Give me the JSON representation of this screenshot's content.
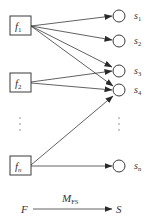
{
  "diagram": {
    "colors": {
      "stroke": "#3a3a3a",
      "background": "#ffffff"
    },
    "features": [
      {
        "id": "f1",
        "base": "f",
        "sub": "1",
        "x": 10,
        "y": 16,
        "w": 21,
        "h": 19
      },
      {
        "id": "f2",
        "base": "f",
        "sub": "2",
        "x": 10,
        "y": 73,
        "w": 21,
        "h": 19
      },
      {
        "id": "fn",
        "base": "f",
        "sub": "n",
        "x": 10,
        "y": 156,
        "w": 21,
        "h": 19
      }
    ],
    "states": [
      {
        "id": "s1",
        "base": "s",
        "sub": "1",
        "cx": 119,
        "cy": 16
      },
      {
        "id": "s2",
        "base": "s",
        "sub": "2",
        "cx": 119,
        "cy": 41
      },
      {
        "id": "s3",
        "base": "s",
        "sub": "3",
        "cx": 119,
        "cy": 71
      },
      {
        "id": "s4",
        "base": "s",
        "sub": "4",
        "cx": 119,
        "cy": 90
      },
      {
        "id": "sn",
        "base": "s",
        "sub": "n",
        "cx": 119,
        "cy": 166
      }
    ],
    "edges": [
      {
        "from": "f1",
        "to": "s1"
      },
      {
        "from": "f1",
        "to": "s2"
      },
      {
        "from": "f1",
        "to": "s3"
      },
      {
        "from": "f1",
        "to": "s4"
      },
      {
        "from": "f2",
        "to": "s3"
      },
      {
        "from": "f2",
        "to": "s4"
      },
      {
        "from": "fn",
        "to": "s4"
      },
      {
        "from": "fn",
        "to": "sn"
      }
    ],
    "ellipsis": {
      "left": "⋮",
      "right": "⋮"
    },
    "mapping": {
      "from_label": "F",
      "to_label": "S",
      "arrow_label_base": "M",
      "arrow_label_sub": "FS"
    }
  }
}
